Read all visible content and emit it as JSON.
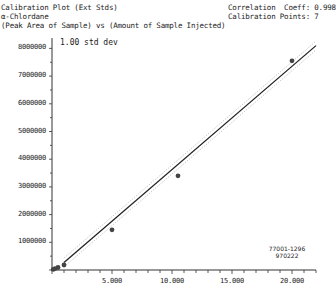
{
  "header": {
    "title": "Calibration Plot (Ext Stds)",
    "compound": "α-Chlordane",
    "subtitle": "(Peak Area of Sample) vs (Amount of Sample Injected)",
    "correlation": "Correlation  Coeff: 0.998",
    "points": "Calibration Points: 7"
  },
  "legend": {
    "band_label": "1.00 std dev"
  },
  "stamp": {
    "line1": "77001-1296",
    "line2": "970222"
  },
  "y_ticks": [
    "8000000",
    "7000000",
    "6000000",
    "5000000",
    "4000000",
    "3000000",
    "2000000",
    "1000000"
  ],
  "x_ticks": [
    "5.000",
    "10.000",
    "15.000",
    "20.000"
  ],
  "colors": {
    "line": "#222222",
    "band": "#9a9a9a",
    "point": "#444444"
  },
  "chart_data": {
    "type": "scatter",
    "xlabel": "Amount of Sample Injected",
    "ylabel": "Peak Area of Sample",
    "xlim": [
      0,
      22
    ],
    "ylim": [
      0,
      8500000
    ],
    "x_tick_labels": [
      "5.000",
      "10.000",
      "15.000",
      "20.000"
    ],
    "y_tick_labels": [
      "1000000",
      "2000000",
      "3000000",
      "4000000",
      "5000000",
      "6000000",
      "7000000",
      "8000000"
    ],
    "grid": false,
    "series": [
      {
        "name": "Calibration standards",
        "x": [
          0.1,
          0.25,
          0.5,
          1.0,
          5.0,
          10.5,
          20.0
        ],
        "y": [
          20000,
          50000,
          90000,
          180000,
          1450000,
          3400000,
          7550000
        ]
      },
      {
        "name": "Regression fit",
        "type": "line",
        "x": [
          0,
          22
        ],
        "y": [
          -100000,
          8100000
        ]
      },
      {
        "name": "1.00 std dev band",
        "type": "line",
        "style": "dotted"
      }
    ],
    "annotations": [
      "Correlation Coeff: 0.998",
      "Calibration Points: 7",
      "1.00 std dev",
      "77001-1296",
      "970222"
    ]
  }
}
